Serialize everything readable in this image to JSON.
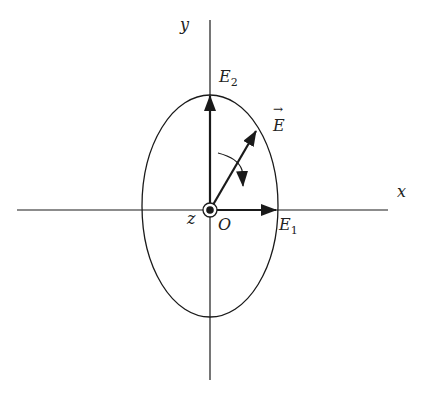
{
  "diagram": {
    "labels": {
      "y_axis": "y",
      "x_axis": "x",
      "z_axis": "z",
      "origin": "O",
      "e2": {
        "base": "E",
        "sub": "2"
      },
      "e1": {
        "base": "E",
        "sub": "1"
      },
      "e_vector": "E",
      "e_vector_arrow": "→"
    },
    "geometry": {
      "origin": [
        210,
        210
      ],
      "ellipse": {
        "cx": 210,
        "cy": 206,
        "rx": 68,
        "ry": 111
      },
      "x_axis": {
        "from": [
          17,
          210
        ],
        "to": [
          388,
          210
        ]
      },
      "y_axis": {
        "from": [
          210,
          20
        ],
        "to": [
          210,
          380
        ]
      },
      "e2_vector": {
        "from": [
          210,
          210
        ],
        "to": [
          210,
          96
        ]
      },
      "e1_vector": {
        "from": [
          210,
          210
        ],
        "to": [
          276,
          210
        ]
      },
      "e_vector": {
        "from": [
          210,
          210
        ],
        "to": [
          256,
          131
        ]
      }
    },
    "colors": {
      "stroke": "#1a1a1a",
      "background": "#ffffff"
    }
  }
}
